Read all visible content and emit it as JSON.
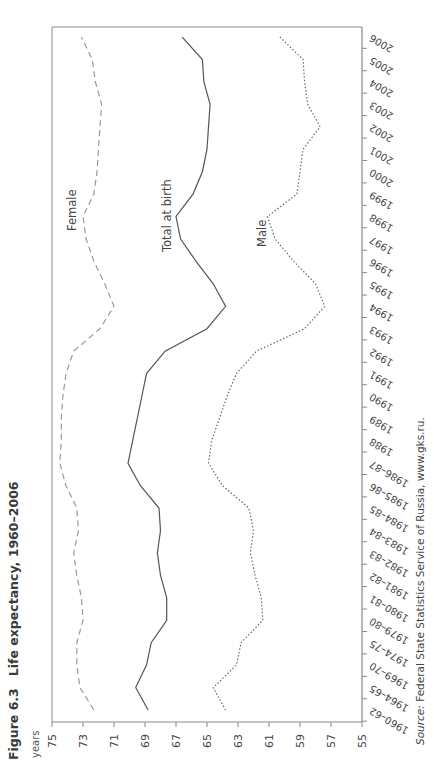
{
  "figure": {
    "number": "Figure 6.3",
    "title": "Life expectancy, 1960–2006"
  },
  "source": {
    "label": "Source:",
    "text": "Federal State Statistics Service of Russia, www.gks.ru."
  },
  "chart_data": {
    "type": "line",
    "title": "Life expectancy, 1960–2006",
    "xlabel": "",
    "ylabel": "years",
    "ylim": [
      55,
      75
    ],
    "yticks": [
      75,
      73,
      71,
      69,
      67,
      65,
      63,
      61,
      59,
      57,
      55
    ],
    "grid": false,
    "legend": "inline labels",
    "categories": [
      "1960–62",
      "1964–65",
      "1969–70",
      "1974–75",
      "1979–80",
      "1980–81",
      "1981–82",
      "1982–83",
      "1983–84",
      "1984–85",
      "1985–86",
      "1986–87",
      "1988",
      "1989",
      "1990",
      "1991",
      "1992",
      "1993",
      "1994",
      "1995",
      "1996",
      "1997",
      "1998",
      "1999",
      "2000",
      "2001",
      "2002",
      "2003",
      "2004",
      "2005",
      "2006"
    ],
    "series": [
      {
        "name": "Female",
        "style": "dashed",
        "values": [
          72.3,
          73.2,
          73.4,
          73.4,
          73.0,
          73.1,
          73.4,
          73.6,
          73.3,
          73.4,
          74.1,
          74.5,
          74.4,
          74.4,
          74.3,
          74.1,
          73.6,
          71.9,
          71.0,
          71.6,
          72.3,
          72.8,
          73.0,
          72.3,
          72.1,
          72.0,
          71.9,
          71.8,
          72.2,
          72.4,
          73.1
        ]
      },
      {
        "name": "Total at birth",
        "style": "solid",
        "values": [
          68.8,
          69.6,
          68.9,
          68.6,
          67.6,
          67.6,
          68.0,
          68.2,
          68.0,
          68.1,
          69.3,
          70.1,
          69.8,
          69.5,
          69.2,
          68.9,
          67.7,
          65.0,
          63.8,
          64.6,
          65.7,
          66.7,
          67.0,
          65.9,
          65.3,
          65.0,
          64.9,
          64.8,
          65.2,
          65.3,
          66.6
        ]
      },
      {
        "name": "Male",
        "style": "dotted",
        "values": [
          63.8,
          64.6,
          63.1,
          62.8,
          61.4,
          61.5,
          61.9,
          62.2,
          62.0,
          62.3,
          64.0,
          64.9,
          64.7,
          64.2,
          63.7,
          63.1,
          61.8,
          58.7,
          57.4,
          58.0,
          59.4,
          60.6,
          61.1,
          59.2,
          59.0,
          58.8,
          57.7,
          58.5,
          58.7,
          58.8,
          60.3
        ]
      }
    ],
    "annotations": [
      {
        "text": "Female",
        "near": "1997"
      },
      {
        "text": "Total at birth",
        "near": "1997"
      },
      {
        "text": "Male",
        "near": "1996"
      }
    ]
  }
}
